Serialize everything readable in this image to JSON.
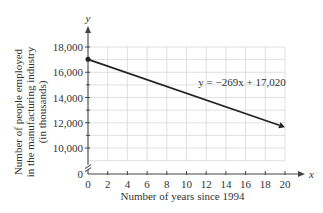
{
  "chart_data": {
    "type": "line",
    "title": "",
    "xlabel": "Number of years since 1994",
    "ylabel_lines": [
      "Number of people employed",
      "in the manufacturing industry",
      "(in thousands)"
    ],
    "x_axis_var": "x",
    "y_axis_var": "y",
    "xlim": [
      0,
      20
    ],
    "ylim": [
      0,
      18000
    ],
    "y_axis_break": [
      0,
      9000
    ],
    "x_ticks": [
      0,
      2,
      4,
      6,
      8,
      10,
      12,
      14,
      16,
      18,
      20
    ],
    "x_tick_labels": [
      "0",
      "2",
      "4",
      "6",
      "8",
      "10",
      "12",
      "14",
      "16",
      "18",
      "20"
    ],
    "y_ticks": [
      0,
      10000,
      12000,
      14000,
      16000,
      18000
    ],
    "y_tick_labels": [
      "0",
      "10,000",
      "12,000",
      "14,000",
      "16,000",
      "18,000"
    ],
    "grid": true,
    "grid_x_step": 2,
    "grid_y_step": 1000,
    "series": [
      {
        "name": "y = −269x + 17,020",
        "slope": -269,
        "intercept": 17020,
        "x": [
          0,
          20
        ],
        "y": [
          17020,
          11640
        ],
        "start_marker": "dot",
        "end_marker": "arrow"
      }
    ],
    "annotations": [
      {
        "text": "y = −269x + 17,020",
        "x": 11,
        "y": 15200
      }
    ]
  }
}
